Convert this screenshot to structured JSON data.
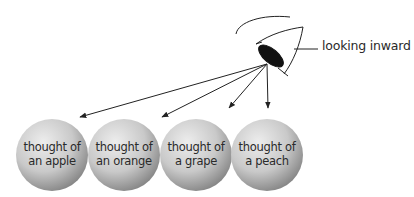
{
  "callout": {
    "label": "looking inward"
  },
  "spheres": [
    {
      "line1": "thought of",
      "line2": "an apple"
    },
    {
      "line1": "thought of",
      "line2": "an orange"
    },
    {
      "line1": "thought of",
      "line2": "a grape"
    },
    {
      "line1": "thought of",
      "line2": "a peach"
    }
  ],
  "colors": {
    "ink": "#222222",
    "sphere_light": "#e6e6e6",
    "sphere_dark": "#8a8a8a",
    "pupil": "#111111"
  }
}
